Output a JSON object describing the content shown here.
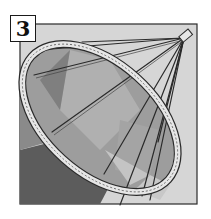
{
  "step": {
    "number": "3"
  },
  "illustration": {
    "subject": "hoop-frame-with-spokes",
    "description": "Ring hoop attached by rods to a hub, with fabric panels inside",
    "colors": {
      "background_panel": "#d6d6d6",
      "fabric_light": "#a9a9a9",
      "fabric_mid": "#8f8f8f",
      "fabric_dark": "#5e5e5e",
      "hoop": "#e6e6e6",
      "line": "#2a2a2a"
    }
  }
}
